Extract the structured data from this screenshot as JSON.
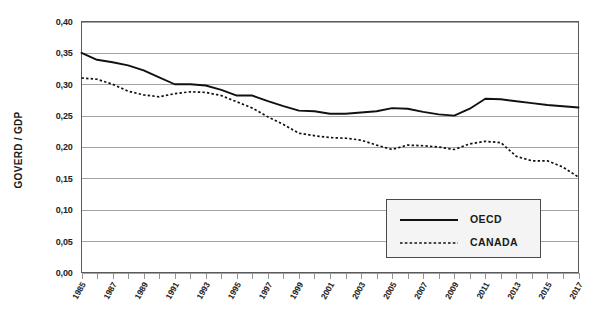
{
  "chart_data": {
    "type": "line",
    "title": "",
    "xlabel": "",
    "ylabel": "GOVERD / GDP",
    "ylim": [
      0.0,
      0.4
    ],
    "xlim": [
      1985,
      2017
    ],
    "grid": true,
    "legend_position": "inside-bottom-right",
    "y_ticks": [
      "0,00",
      "0,05",
      "0,10",
      "0,15",
      "0,20",
      "0,25",
      "0,30",
      "0,35",
      "0,40"
    ],
    "y_tick_values": [
      0.0,
      0.05,
      0.1,
      0.15,
      0.2,
      0.25,
      0.3,
      0.35,
      0.4
    ],
    "x_tick_labels": [
      "1985",
      "1987",
      "1989",
      "1991",
      "1993",
      "1995",
      "1997",
      "1999",
      "2001",
      "2003",
      "2005",
      "2007",
      "2009",
      "2011",
      "2013",
      "2015",
      "2017"
    ],
    "x": [
      1985,
      1986,
      1987,
      1988,
      1989,
      1990,
      1991,
      1992,
      1993,
      1994,
      1995,
      1996,
      1997,
      1998,
      1999,
      2000,
      2001,
      2002,
      2003,
      2004,
      2005,
      2006,
      2007,
      2008,
      2009,
      2010,
      2011,
      2012,
      2013,
      2014,
      2015,
      2016,
      2017
    ],
    "series": [
      {
        "name": "OECD",
        "style": "solid",
        "color": "#111111",
        "values": [
          0.35,
          0.339,
          0.335,
          0.33,
          0.322,
          0.311,
          0.3,
          0.3,
          0.298,
          0.291,
          0.282,
          0.282,
          0.273,
          0.265,
          0.258,
          0.257,
          0.253,
          0.253,
          0.255,
          0.257,
          0.262,
          0.261,
          0.256,
          0.252,
          0.25,
          0.261,
          0.277,
          0.276,
          0.273,
          0.27,
          0.267,
          0.265,
          0.263
        ]
      },
      {
        "name": "CANADA",
        "style": "dashed",
        "color": "#111111",
        "values": [
          0.31,
          0.308,
          0.3,
          0.289,
          0.283,
          0.28,
          0.285,
          0.288,
          0.287,
          0.282,
          0.272,
          0.262,
          0.248,
          0.236,
          0.222,
          0.218,
          0.215,
          0.214,
          0.211,
          0.203,
          0.196,
          0.203,
          0.202,
          0.2,
          0.196,
          0.205,
          0.209,
          0.207,
          0.185,
          0.178,
          0.178,
          0.168,
          0.152
        ]
      }
    ]
  },
  "legend": {
    "items": [
      {
        "label": "OECD",
        "style": "solid"
      },
      {
        "label": "CANADA",
        "style": "dashed"
      }
    ]
  }
}
